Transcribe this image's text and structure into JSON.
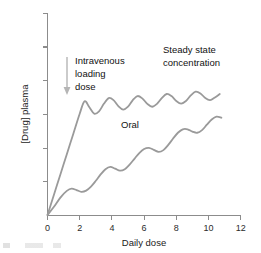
{
  "chart_data": {
    "type": "line",
    "title": "",
    "xlabel": "Daily dose",
    "ylabel": "[Drug] plasma",
    "xlim": [
      0,
      12
    ],
    "ylim": [
      0,
      7
    ],
    "grid": false,
    "legend": "none",
    "x_ticks": [
      "0",
      "2",
      "4",
      "6",
      "8",
      "10",
      "12"
    ],
    "x_tick_values": [
      0,
      2,
      4,
      6,
      8,
      10,
      12
    ],
    "y_ticks": [
      "",
      "",
      "",
      "",
      "",
      "",
      ""
    ],
    "y_tick_values": [
      0,
      1,
      2,
      3,
      4,
      5,
      6
    ],
    "y_axis_labeled": "false",
    "series": [
      {
        "name": "Intravenous loading dose",
        "color": "#9a9a9a",
        "description": "Rapid linear rise to steady state then oscillating plateau",
        "x": [
          0,
          0.4,
          0.8,
          1.2,
          1.6,
          2.0,
          2.3,
          2.6,
          2.9,
          3.2,
          3.5,
          3.8,
          4.1,
          4.4,
          4.7,
          5.0,
          5.3,
          5.6,
          5.9,
          6.2,
          6.5,
          6.8,
          7.1,
          7.4,
          7.7,
          8.0,
          8.3,
          8.6,
          8.9,
          9.2,
          9.5,
          9.8,
          10.1,
          10.4,
          10.7
        ],
        "y": [
          0.02,
          0.72,
          1.42,
          2.12,
          2.82,
          3.52,
          3.95,
          3.74,
          3.52,
          3.6,
          3.86,
          4.06,
          3.99,
          3.78,
          3.66,
          3.76,
          3.99,
          4.13,
          4.04,
          3.86,
          3.76,
          3.86,
          4.06,
          4.2,
          4.13,
          3.96,
          3.87,
          3.96,
          4.15,
          4.28,
          4.22,
          4.06,
          3.99,
          4.08,
          4.2
        ]
      },
      {
        "name": "Oral",
        "color": "#9a9a9a",
        "description": "Slow oscillating accumulation approaching steady state",
        "x": [
          0,
          0.4,
          0.8,
          1.2,
          1.5,
          1.8,
          2.1,
          2.4,
          2.7,
          3.0,
          3.3,
          3.6,
          3.9,
          4.2,
          4.5,
          4.8,
          5.1,
          5.4,
          5.7,
          6.0,
          6.3,
          6.6,
          6.9,
          7.2,
          7.5,
          7.8,
          8.1,
          8.4,
          8.7,
          9.0,
          9.3,
          9.6,
          9.9,
          10.2,
          10.5,
          10.8
        ],
        "y": [
          0.02,
          0.3,
          0.62,
          0.85,
          0.93,
          0.88,
          0.82,
          0.86,
          1.0,
          1.2,
          1.42,
          1.6,
          1.68,
          1.62,
          1.55,
          1.6,
          1.76,
          1.96,
          2.16,
          2.3,
          2.34,
          2.27,
          2.2,
          2.26,
          2.44,
          2.66,
          2.86,
          2.98,
          2.98,
          2.9,
          2.86,
          2.95,
          3.14,
          3.32,
          3.42,
          3.38
        ]
      }
    ],
    "annotations": [
      {
        "name": "iv-loading-dose-label",
        "lines": [
          "Intravenous",
          "loading",
          "dose"
        ],
        "text": "Intravenous loading dose"
      },
      {
        "name": "steady-state-label",
        "lines": [
          "Steady state",
          "concentration"
        ],
        "text": "Steady state concentration"
      },
      {
        "name": "oral-label",
        "lines": [
          "Oral"
        ],
        "text": "Oral"
      }
    ],
    "arrow": {
      "name": "iv-dose-arrow",
      "direction": "down",
      "color": "#b5b5b5"
    },
    "colors": {
      "curve": "#9a9a9a",
      "axis": "#8c8c8c",
      "text": "#111111",
      "arrow": "#b5b5b5",
      "background": "#ffffff"
    }
  },
  "axis": {
    "x_title": "Daily dose",
    "y_title": "[Drug] plasma",
    "x_tick_0": "0",
    "x_tick_1": "2",
    "x_tick_2": "4",
    "x_tick_3": "6",
    "x_tick_4": "8",
    "x_tick_5": "10",
    "x_tick_6": "12"
  },
  "annotations": {
    "iv_line1": "Intravenous",
    "iv_line2": "loading",
    "iv_line3": "dose",
    "steady_line1": "Steady state",
    "steady_line2": "concentration",
    "oral": "Oral"
  }
}
